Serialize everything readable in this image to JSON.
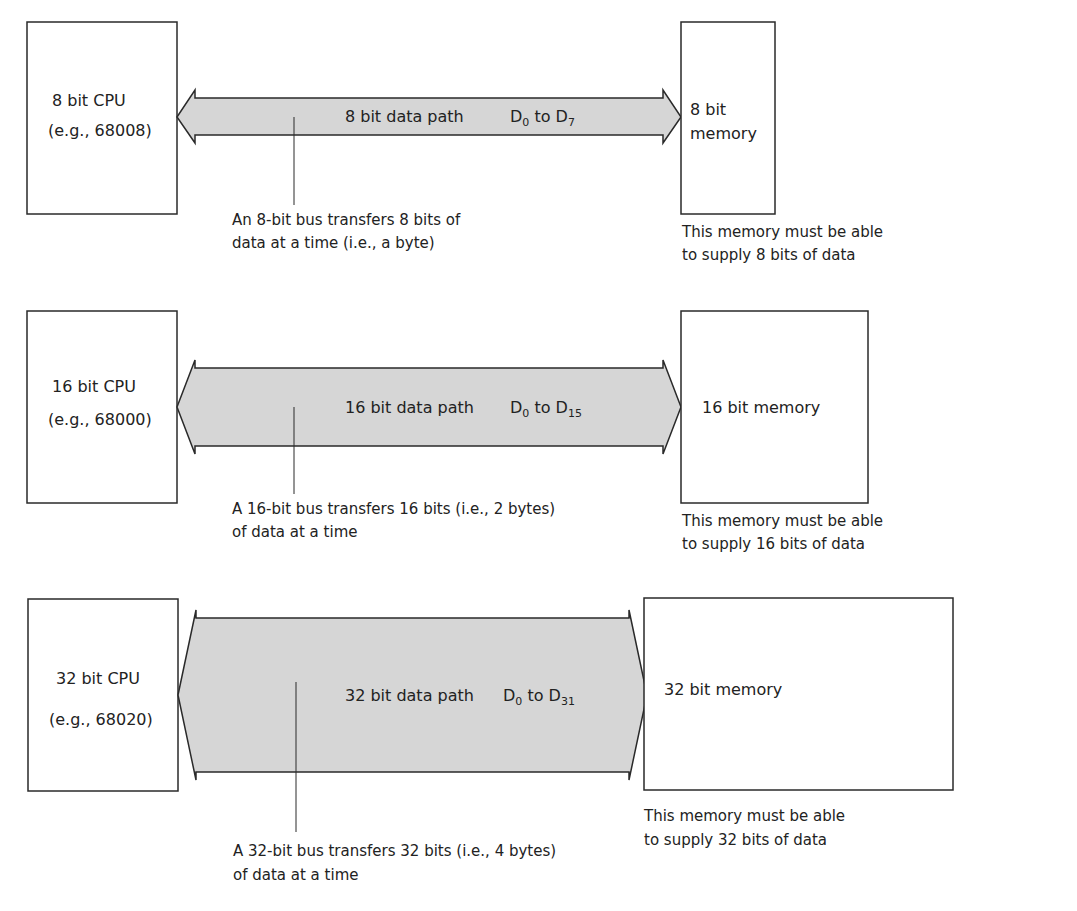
{
  "diagram": {
    "colors": {
      "bus_fill": "#d6d6d6",
      "stroke": "#2a2a2a",
      "text": "#222222",
      "background": "#ffffff"
    },
    "rows": [
      {
        "cpu": {
          "line1": "8 bit CPU",
          "line2": "(e.g., 68008)"
        },
        "bus": {
          "label": "8 bit data path",
          "range_start": "D",
          "range_start_sub": "0",
          "range_to": "to",
          "range_end": "D",
          "range_end_sub": "7"
        },
        "memory": {
          "line1": "8 bit",
          "line2": "memory"
        },
        "bus_note": {
          "line1": "An 8-bit bus transfers 8 bits of",
          "line2": "data at a time (i.e., a byte)"
        },
        "memory_note": {
          "line1": "This memory must be able",
          "line2": "to supply 8 bits of data"
        }
      },
      {
        "cpu": {
          "line1": "16 bit CPU",
          "line2": "(e.g., 68000)"
        },
        "bus": {
          "label": "16 bit data path",
          "range_start": "D",
          "range_start_sub": "0",
          "range_to": "to",
          "range_end": "D",
          "range_end_sub": "15"
        },
        "memory": {
          "line1": "16 bit memory"
        },
        "bus_note": {
          "line1": "A 16-bit bus transfers 16 bits (i.e., 2 bytes)",
          "line2": "of data at a time"
        },
        "memory_note": {
          "line1": "This memory must be able",
          "line2": "to supply 16 bits of data"
        }
      },
      {
        "cpu": {
          "line1": "32 bit CPU",
          "line2": "(e.g., 68020)"
        },
        "bus": {
          "label": "32 bit data path",
          "range_start": "D",
          "range_start_sub": "0",
          "range_to": "to",
          "range_end": "D",
          "range_end_sub": "31"
        },
        "memory": {
          "line1": "32 bit memory"
        },
        "bus_note": {
          "line1": "A 32-bit bus transfers 32 bits (i.e., 4 bytes)",
          "line2": "of data at a time"
        },
        "memory_note": {
          "line1": "This memory must be able",
          "line2": "to supply 32 bits of data"
        }
      }
    ]
  }
}
